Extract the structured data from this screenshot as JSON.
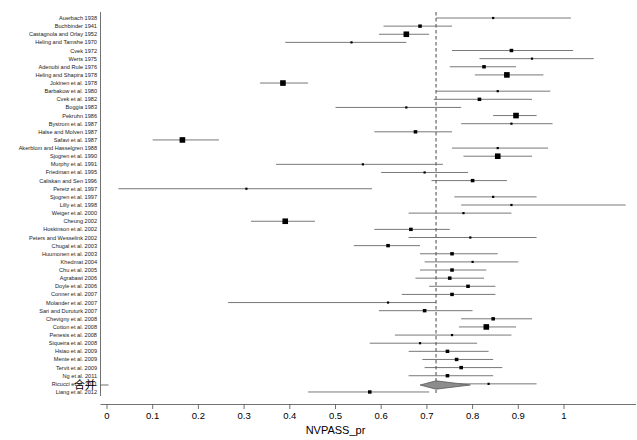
{
  "chart_data": {
    "type": "forest",
    "title": "",
    "xlabel": "NVPASS_pr",
    "ylabel": "",
    "xlim": [
      -0.02,
      1.16
    ],
    "grid": false,
    "reference_line": 0.72,
    "tick_values": [
      0,
      0.1,
      0.2,
      0.3,
      0.4,
      0.5,
      0.6,
      0.7,
      0.8,
      0.9,
      1
    ],
    "tick_labels": [
      "0",
      "0.1",
      "0.2",
      "0.3",
      "0.4",
      "0.5",
      "0.6",
      "0.7",
      "0.8",
      "0.9",
      "1"
    ],
    "summary": {
      "label": "合并",
      "estimate": 0.72,
      "ci_low": 0.685,
      "ci_high": 0.795
    },
    "studies": [
      {
        "label": "Auerbach 1938",
        "estimate": 0.845,
        "ci_low": 0.72,
        "ci_high": 1.015,
        "weight": 1
      },
      {
        "label": "Buchbinder 1941",
        "estimate": 0.685,
        "ci_low": 0.605,
        "ci_high": 0.755,
        "weight": 2
      },
      {
        "label": "Castagnola and Orlay 1952",
        "estimate": 0.655,
        "ci_low": 0.595,
        "ci_high": 0.705,
        "weight": 3
      },
      {
        "label": "Heling and Tamshe 1970",
        "estimate": 0.535,
        "ci_low": 0.39,
        "ci_high": 0.655,
        "weight": 1
      },
      {
        "label": "Cvek 1972",
        "estimate": 0.885,
        "ci_low": 0.755,
        "ci_high": 1.02,
        "weight": 2
      },
      {
        "label": "Werts 1975",
        "estimate": 0.93,
        "ci_low": 0.815,
        "ci_high": 1.065,
        "weight": 1
      },
      {
        "label": "Adenubi and Rule 1976",
        "estimate": 0.825,
        "ci_low": 0.75,
        "ci_high": 0.895,
        "weight": 2
      },
      {
        "label": "Heling and Shapira 1978",
        "estimate": 0.875,
        "ci_low": 0.805,
        "ci_high": 0.955,
        "weight": 3
      },
      {
        "label": "Jokinen et al. 1978",
        "estimate": 0.385,
        "ci_low": 0.335,
        "ci_high": 0.44,
        "weight": 3
      },
      {
        "label": "Barbakow et al. 1980",
        "estimate": 0.855,
        "ci_low": 0.72,
        "ci_high": 0.97,
        "weight": 1
      },
      {
        "label": "Cvek et al. 1982",
        "estimate": 0.815,
        "ci_low": 0.715,
        "ci_high": 0.93,
        "weight": 2
      },
      {
        "label": "Boggia 1983",
        "estimate": 0.655,
        "ci_low": 0.5,
        "ci_high": 0.775,
        "weight": 1
      },
      {
        "label": "Pekruhn 1986",
        "estimate": 0.895,
        "ci_low": 0.845,
        "ci_high": 0.94,
        "weight": 3
      },
      {
        "label": "Bystrom et al. 1987",
        "estimate": 0.885,
        "ci_low": 0.775,
        "ci_high": 0.975,
        "weight": 1
      },
      {
        "label": "Halse and Molven 1987",
        "estimate": 0.675,
        "ci_low": 0.585,
        "ci_high": 0.755,
        "weight": 2
      },
      {
        "label": "Safavi et al. 1987",
        "estimate": 0.165,
        "ci_low": 0.1,
        "ci_high": 0.245,
        "weight": 3
      },
      {
        "label": "Akerblom and Hasselgren 1988",
        "estimate": 0.855,
        "ci_low": 0.755,
        "ci_high": 0.965,
        "weight": 1
      },
      {
        "label": "Sjogren et al. 1990",
        "estimate": 0.855,
        "ci_low": 0.78,
        "ci_high": 0.93,
        "weight": 3
      },
      {
        "label": "Murphy et al. 1991",
        "estimate": 0.56,
        "ci_low": 0.37,
        "ci_high": 0.735,
        "weight": 1
      },
      {
        "label": "Friedman et al. 1995",
        "estimate": 0.695,
        "ci_low": 0.6,
        "ci_high": 0.79,
        "weight": 1
      },
      {
        "label": "Caliskan and Sen 1996",
        "estimate": 0.8,
        "ci_low": 0.71,
        "ci_high": 0.875,
        "weight": 2
      },
      {
        "label": "Peretz et al. 1997",
        "estimate": 0.305,
        "ci_low": 0.025,
        "ci_high": 0.58,
        "weight": 1
      },
      {
        "label": "Sjogren et al. 1997",
        "estimate": 0.845,
        "ci_low": 0.76,
        "ci_high": 0.94,
        "weight": 1
      },
      {
        "label": "Lilly et al. 1998",
        "estimate": 0.885,
        "ci_low": 0.775,
        "ci_high": 1.135,
        "weight": 1
      },
      {
        "label": "Weiger et al. 2000",
        "estimate": 0.78,
        "ci_low": 0.66,
        "ci_high": 0.885,
        "weight": 1
      },
      {
        "label": "Cheung 2002",
        "estimate": 0.39,
        "ci_low": 0.315,
        "ci_high": 0.455,
        "weight": 3
      },
      {
        "label": "Hoskinson et al. 2002",
        "estimate": 0.665,
        "ci_low": 0.585,
        "ci_high": 0.75,
        "weight": 2
      },
      {
        "label": "Peters and Wesselink 2002",
        "estimate": 0.795,
        "ci_low": 0.66,
        "ci_high": 0.94,
        "weight": 1
      },
      {
        "label": "Chugal et al. 2003",
        "estimate": 0.615,
        "ci_low": 0.54,
        "ci_high": 0.685,
        "weight": 2
      },
      {
        "label": "Huumonen et al. 2003",
        "estimate": 0.755,
        "ci_low": 0.685,
        "ci_high": 0.855,
        "weight": 2
      },
      {
        "label": "Khedmat 2004",
        "estimate": 0.8,
        "ci_low": 0.695,
        "ci_high": 0.9,
        "weight": 1
      },
      {
        "label": "Chu et al. 2005",
        "estimate": 0.755,
        "ci_low": 0.685,
        "ci_high": 0.83,
        "weight": 2
      },
      {
        "label": "Agrabawi 2006",
        "estimate": 0.75,
        "ci_low": 0.675,
        "ci_high": 0.825,
        "weight": 2
      },
      {
        "label": "Doyle et al. 2006",
        "estimate": 0.79,
        "ci_low": 0.705,
        "ci_high": 0.85,
        "weight": 2
      },
      {
        "label": "Conner et al. 2007",
        "estimate": 0.755,
        "ci_low": 0.645,
        "ci_high": 0.85,
        "weight": 2
      },
      {
        "label": "Molander et al. 2007",
        "estimate": 0.615,
        "ci_low": 0.265,
        "ci_high": 0.72,
        "weight": 1
      },
      {
        "label": "Sari and Duruturk 2007",
        "estimate": 0.695,
        "ci_low": 0.595,
        "ci_high": 0.8,
        "weight": 2
      },
      {
        "label": "Chevigny et al. 2008",
        "estimate": 0.845,
        "ci_low": 0.775,
        "ci_high": 0.93,
        "weight": 2
      },
      {
        "label": "Cotton et al. 2008",
        "estimate": 0.83,
        "ci_low": 0.77,
        "ci_high": 0.895,
        "weight": 3
      },
      {
        "label": "Penesis et al. 2008",
        "estimate": 0.755,
        "ci_low": 0.63,
        "ci_high": 0.885,
        "weight": 1
      },
      {
        "label": "Siqueira et al. 2008",
        "estimate": 0.685,
        "ci_low": 0.575,
        "ci_high": 0.81,
        "weight": 1
      },
      {
        "label": "Hsiao et al. 2009",
        "estimate": 0.745,
        "ci_low": 0.66,
        "ci_high": 0.835,
        "weight": 2
      },
      {
        "label": "Mente et al. 2009",
        "estimate": 0.765,
        "ci_low": 0.69,
        "ci_high": 0.845,
        "weight": 2
      },
      {
        "label": "Tervit et al. 2009",
        "estimate": 0.775,
        "ci_low": 0.695,
        "ci_high": 0.865,
        "weight": 2
      },
      {
        "label": "Ng et al. 2011",
        "estimate": 0.745,
        "ci_low": 0.66,
        "ci_high": 0.845,
        "weight": 2
      },
      {
        "label": "Ricucci et al. 2011",
        "estimate": 0.835,
        "ci_low": 0.77,
        "ci_high": 0.94,
        "weight": 1
      },
      {
        "label": "Liang et al. 2012",
        "estimate": 0.575,
        "ci_low": 0.44,
        "ci_high": 0.705,
        "weight": 2
      }
    ]
  },
  "colors": {
    "marker": "#000000",
    "line": "#555555",
    "axis": "#4d4d4d",
    "reference": "#333333",
    "diamond": "#8c8c8c",
    "background": "#ffffff"
  }
}
